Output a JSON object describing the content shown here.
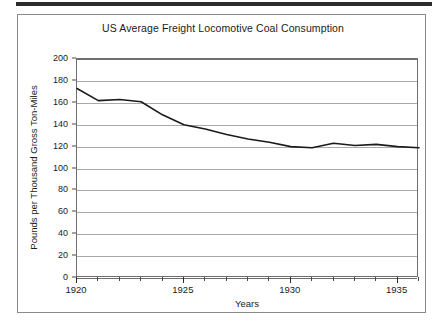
{
  "chart_data": {
    "type": "line",
    "title": "US Average Freight Locomotive Coal Consumption",
    "xlabel": "Years",
    "ylabel": "Pounds per Thousand Gross Ton-Miles",
    "xlim": [
      1920,
      1936
    ],
    "ylim": [
      0,
      200
    ],
    "xticks": [
      1920,
      1925,
      1930,
      1935
    ],
    "xtick_labels": [
      "1920",
      "1925",
      "1930",
      "1935"
    ],
    "yticks": [
      0,
      20,
      40,
      60,
      80,
      100,
      120,
      140,
      160,
      180,
      200
    ],
    "ytick_labels": [
      "0",
      "20",
      "40",
      "60",
      "80",
      "100",
      "120",
      "140",
      "160",
      "180",
      "200"
    ],
    "minor_xticks": [
      1921,
      1922,
      1923,
      1924,
      1926,
      1927,
      1928,
      1929,
      1931,
      1932,
      1933,
      1934,
      1936
    ],
    "grid": "horizontal",
    "legend": null,
    "line_color": "#1a1a1a",
    "line_width": 1.6,
    "x": [
      1920,
      1921,
      1922,
      1923,
      1924,
      1925,
      1926,
      1927,
      1928,
      1929,
      1930,
      1931,
      1932,
      1933,
      1934,
      1935,
      1936
    ],
    "values": [
      173,
      162,
      163,
      161,
      149,
      140,
      136,
      131,
      127,
      124,
      120,
      119,
      123,
      121,
      122,
      120,
      119
    ],
    "series": [
      {
        "name": "US Average Freight Locomotive Coal Consumption",
        "values": [
          173,
          162,
          163,
          161,
          149,
          140,
          136,
          131,
          127,
          124,
          120,
          119,
          123,
          121,
          122,
          120,
          119
        ]
      }
    ]
  }
}
